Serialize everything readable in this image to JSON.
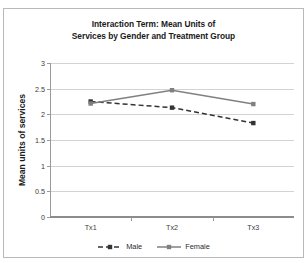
{
  "chart_data": {
    "type": "line",
    "title": "Interaction Term: Mean Units of Services by Gender and Treatment Group",
    "title_lines": [
      "Interaction Term: Mean Units of",
      "Services by Gender and Treatment Group"
    ],
    "xlabel": "",
    "ylabel": "Mean units of services",
    "categories": [
      "Tx1",
      "Tx2",
      "Tx3"
    ],
    "ylim": [
      0,
      3
    ],
    "ytick_labels": [
      "0",
      "0.5",
      "1",
      "1.5",
      "2",
      "2.5",
      "3"
    ],
    "ytick_values": [
      0,
      0.5,
      1,
      1.5,
      2,
      2.5,
      3
    ],
    "grid": true,
    "legend_position": "bottom",
    "series": [
      {
        "name": "Male",
        "values": [
          2.25,
          2.13,
          1.83
        ],
        "color": "#333333",
        "style": "dashed",
        "marker": "square"
      },
      {
        "name": "Female",
        "values": [
          2.21,
          2.47,
          2.2
        ],
        "color": "#808080",
        "style": "solid",
        "marker": "square"
      }
    ]
  },
  "colors": {
    "male": "#333333",
    "female": "#808080",
    "grid": "#d3d3d3",
    "axis": "#8c8c8c",
    "frame": "#b9b9b9",
    "text": "#1a1a1a"
  }
}
